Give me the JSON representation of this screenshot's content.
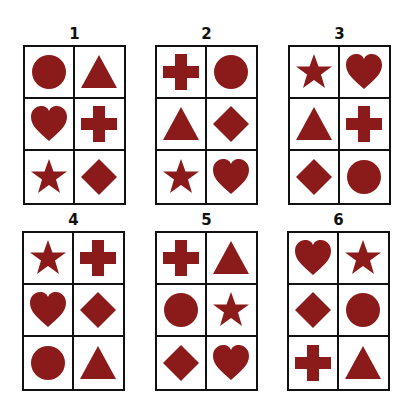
{
  "shape_color": "#8b1a1a",
  "panels": [
    {
      "label": "1",
      "cells": [
        "circle",
        "triangle",
        "heart",
        "cross",
        "star",
        "diamond"
      ]
    },
    {
      "label": "2",
      "cells": [
        "cross",
        "circle",
        "triangle",
        "diamond",
        "star",
        "heart"
      ]
    },
    {
      "label": "3",
      "cells": [
        "star",
        "heart",
        "triangle",
        "cross",
        "diamond",
        "circle"
      ]
    },
    {
      "label": "4",
      "cells": [
        "star",
        "cross",
        "heart",
        "diamond",
        "circle",
        "triangle"
      ]
    },
    {
      "label": "5",
      "cells": [
        "cross",
        "triangle",
        "circle",
        "star",
        "diamond",
        "heart"
      ]
    },
    {
      "label": "6",
      "cells": [
        "heart",
        "star",
        "diamond",
        "circle",
        "cross",
        "triangle"
      ]
    }
  ]
}
